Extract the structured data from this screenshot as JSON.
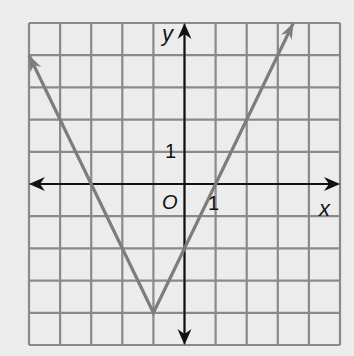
{
  "chart_data": {
    "type": "line",
    "title": "",
    "function": "y = 2|x + 1| - 4",
    "xlabel": "x",
    "ylabel": "y",
    "xlim": [
      -5,
      5
    ],
    "ylim": [
      -5,
      5
    ],
    "grid": true,
    "origin_label": "O",
    "x_tick_label": {
      "value": 1,
      "text": "1"
    },
    "y_tick_label": {
      "value": 1,
      "text": "1"
    },
    "series": [
      {
        "name": "absolute value graph",
        "x": [
          -5,
          -3,
          -1,
          1,
          3.5
        ],
        "y": [
          4,
          0,
          -4,
          0,
          5
        ],
        "vertex": [
          -1,
          -4
        ],
        "color": "#7d7d7d",
        "arrows_at_ends": true
      }
    ],
    "legend": null
  },
  "colors": {
    "background": "#ececec",
    "grid": "#8a8a8a",
    "axis": "#111111",
    "line": "#7d7d7d"
  }
}
